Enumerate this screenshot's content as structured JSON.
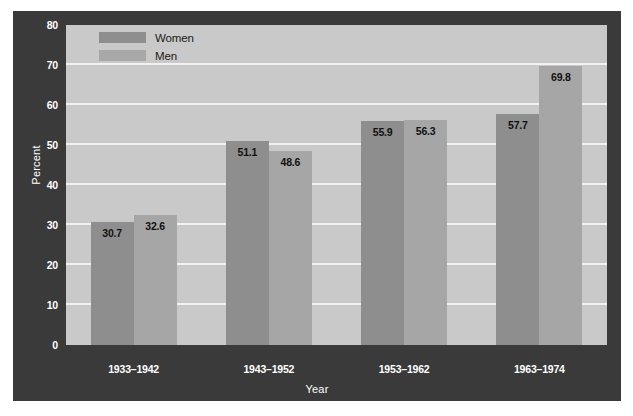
{
  "chart_data": {
    "type": "bar",
    "title": "",
    "xlabel": "Year",
    "ylabel": "Percent",
    "ylim": [
      0,
      80
    ],
    "yticks": [
      0,
      10,
      20,
      30,
      40,
      50,
      60,
      70,
      80
    ],
    "grid": true,
    "legend_position": "top-left",
    "categories": [
      "1933–1942",
      "1943–1952",
      "1953–1962",
      "1963–1974"
    ],
    "series": [
      {
        "name": "Women",
        "color": "#8e8e8e",
        "values": [
          30.7,
          51.1,
          55.9,
          57.7
        ],
        "labels": [
          "30.7",
          "51.1",
          "55.9",
          "57.7"
        ]
      },
      {
        "name": "Men",
        "color": "#a6a6a6",
        "values": [
          32.6,
          48.6,
          56.3,
          69.8
        ],
        "labels": [
          "32.6",
          "48.6",
          "56.3",
          "69.8"
        ]
      }
    ]
  },
  "colors": {
    "panel_background": "#3a3a3a",
    "plot_background": "#c9c9c9",
    "gridline": "#f2f2f2",
    "axis_text": "#ffffff",
    "value_label_text": "#111111",
    "women_bar": "#8e8e8e",
    "men_bar": "#a6a6a6"
  },
  "legend": {
    "items": [
      {
        "label": "Women",
        "swatch": "women"
      },
      {
        "label": "Men",
        "swatch": "men"
      }
    ]
  },
  "axes": {
    "y": {
      "label": "Percent",
      "ticks": [
        "80",
        "70",
        "60",
        "50",
        "40",
        "30",
        "20",
        "10",
        "0"
      ]
    },
    "x": {
      "label": "Year",
      "ticks": [
        "1933–1942",
        "1943–1952",
        "1953–1962",
        "1963–1974"
      ]
    }
  }
}
